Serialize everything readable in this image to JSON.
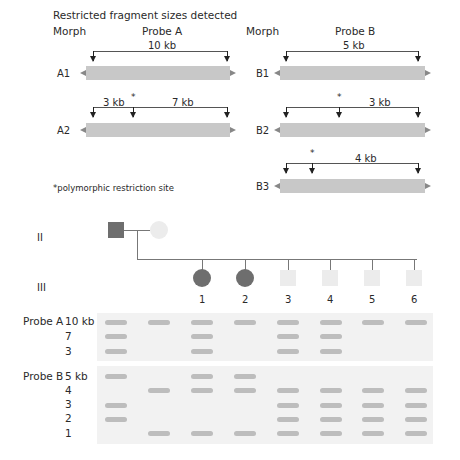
{
  "header": {
    "title": "Restricted fragment sizes detected",
    "morph_label_a": "Morph",
    "probe_a_label": "Probe A",
    "morph_label_b": "Morph",
    "probe_b_label": "Probe B"
  },
  "morphs": {
    "A1": {
      "label": "A1",
      "segments": [
        "10 kb"
      ]
    },
    "A2": {
      "label": "A2",
      "segments": [
        "3 kb",
        "7 kb"
      ],
      "star": "*"
    },
    "B1": {
      "label": "B1",
      "segments": [
        "5 kb"
      ]
    },
    "B2": {
      "label": "B2",
      "segments": [
        "3 kb"
      ],
      "star": "*"
    },
    "B3": {
      "label": "B3",
      "segments": [
        "4 kb"
      ],
      "star": "*"
    }
  },
  "footnote": "*polymorphic restriction site",
  "pedigree": {
    "generations": [
      "II",
      "III"
    ],
    "children_numbers": [
      "1",
      "2",
      "3",
      "4",
      "5",
      "6"
    ],
    "individuals": [
      {
        "id": "II-father",
        "sex": "male",
        "affected": true
      },
      {
        "id": "II-mother",
        "sex": "female",
        "affected": false
      },
      {
        "id": "III-1",
        "sex": "female",
        "affected": true
      },
      {
        "id": "III-2",
        "sex": "female",
        "affected": true
      },
      {
        "id": "III-3",
        "sex": "male",
        "affected": false
      },
      {
        "id": "III-4",
        "sex": "male",
        "affected": false
      },
      {
        "id": "III-5",
        "sex": "male",
        "affected": false
      },
      {
        "id": "III-6",
        "sex": "male",
        "affected": false
      }
    ]
  },
  "gel": {
    "probe_a": {
      "label": "Probe A",
      "sizes": [
        "10 kb",
        "7",
        "3"
      ],
      "lanes": [
        [
          1,
          1,
          1
        ],
        [
          1,
          0,
          0
        ],
        [
          1,
          1,
          1
        ],
        [
          1,
          0,
          0
        ],
        [
          1,
          1,
          1
        ],
        [
          1,
          1,
          1
        ],
        [
          1,
          0,
          0
        ],
        [
          1,
          0,
          0
        ]
      ]
    },
    "probe_b": {
      "label": "Probe B",
      "sizes": [
        "5 kb",
        "4",
        "3",
        "2",
        "1"
      ],
      "lanes": [
        [
          1,
          0,
          1,
          1,
          0
        ],
        [
          0,
          1,
          0,
          0,
          1
        ],
        [
          1,
          1,
          0,
          0,
          1
        ],
        [
          1,
          1,
          0,
          0,
          1
        ],
        [
          0,
          1,
          1,
          1,
          1
        ],
        [
          0,
          1,
          1,
          1,
          1
        ],
        [
          0,
          1,
          1,
          1,
          1
        ],
        [
          0,
          1,
          1,
          1,
          1
        ]
      ]
    }
  },
  "colors": {
    "affected": "#6e6e6e",
    "unaffected": "#ececec",
    "bar": "#c8c8c8",
    "band": "#bdbdbd",
    "gel_bg": "#f2f2f2"
  }
}
